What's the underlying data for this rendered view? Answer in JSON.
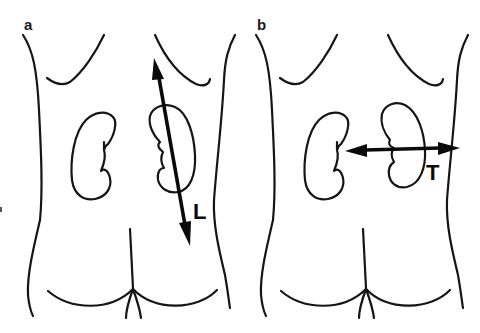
{
  "figure": {
    "panels": [
      {
        "id": "a",
        "label": "a",
        "measurement": {
          "label": "L",
          "meaning": "longitudinal (length) axis through right-side kidney",
          "orientation": "near-vertical, slightly tilted"
        }
      },
      {
        "id": "b",
        "label": "b",
        "measurement": {
          "label": "T",
          "meaning": "transverse axis through right-side kidney",
          "orientation": "horizontal"
        }
      }
    ]
  },
  "colors": {
    "background": "#ffffff",
    "line": "#151515",
    "arrow": "#0a0a0a"
  }
}
